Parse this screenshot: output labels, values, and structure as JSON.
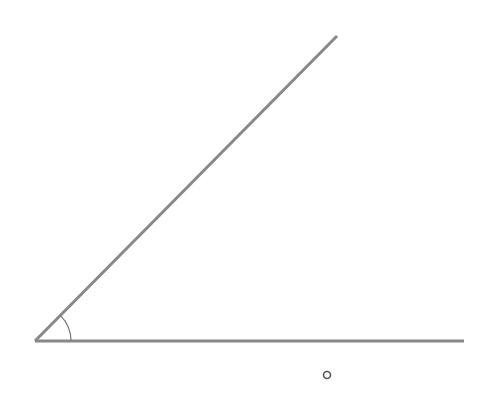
{
  "diagram": {
    "type": "angle",
    "vertex": {
      "x": 35,
      "y": 341
    },
    "ray_upper_end": {
      "x": 337,
      "y": 36
    },
    "ray_base_end": {
      "x": 464,
      "y": 341
    },
    "arc_radius": 36,
    "label": "°",
    "label_position": {
      "x": 321,
      "y": 364
    },
    "line_color": "#888888",
    "arc_color": "#777777"
  }
}
